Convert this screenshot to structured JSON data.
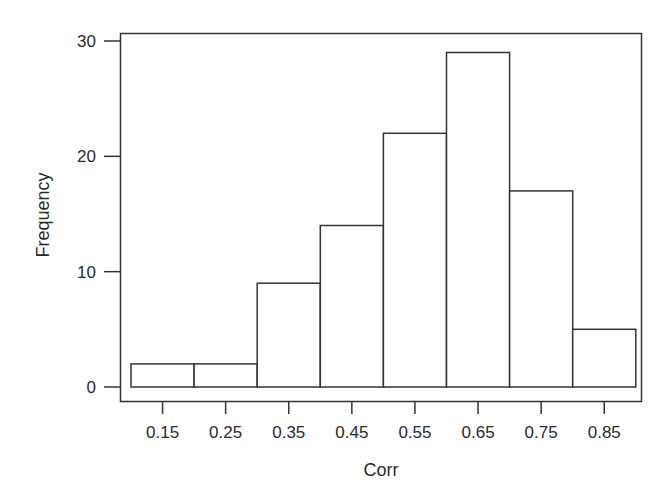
{
  "chart_data": {
    "type": "bar",
    "subtype": "histogram",
    "title": "",
    "xlabel": "Corr",
    "ylabel": "Frequency",
    "categories": [
      "0.15",
      "0.25",
      "0.35",
      "0.45",
      "0.55",
      "0.65",
      "0.75",
      "0.85"
    ],
    "bin_edges": [
      0.1,
      0.2,
      0.3,
      0.4,
      0.5,
      0.6,
      0.7,
      0.8,
      0.9
    ],
    "values": [
      2,
      2,
      9,
      14,
      22,
      29,
      17,
      5
    ],
    "yticks": [
      "0",
      "10",
      "20",
      "30"
    ],
    "ytick_values": [
      0,
      10,
      20,
      30
    ],
    "ylim": [
      0,
      30
    ],
    "grid": false,
    "legend": null,
    "bar_fill": "#ffffff",
    "bar_stroke": "#333333"
  }
}
